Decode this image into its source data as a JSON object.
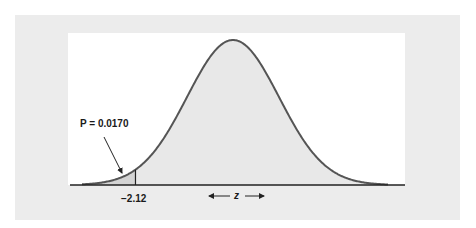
{
  "figure": {
    "p_label": "P = 0.0170",
    "z_value_label": "−2.12",
    "axis_label": "z",
    "colors": {
      "outer_background": "#ececec",
      "plot_background": "#ffffff",
      "curve_fill": "#e8e8e8",
      "curve_stroke": "#555555",
      "tail_fill": "#d4d4d4",
      "axis": "#222222"
    }
  },
  "chart_data": {
    "type": "area",
    "title": "",
    "distribution": "standard normal",
    "xlabel": "z",
    "ylabel": "",
    "shaded_region": {
      "from": "-inf",
      "to": -2.12,
      "area": 0.017
    },
    "annotations": [
      {
        "text": "P = 0.0170",
        "points_to": "left tail area"
      },
      {
        "text": "−2.12",
        "position": "x-axis tick"
      },
      {
        "text": "← z →",
        "position": "below axis, centered"
      }
    ],
    "grid": false,
    "legend": null
  }
}
